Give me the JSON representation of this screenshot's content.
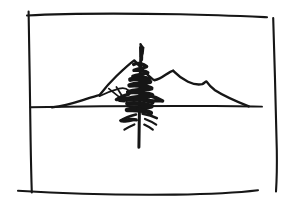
{
  "artwork": {
    "title": "Mountain Landscape with Conifer",
    "medium": "ink pen sketch",
    "surface": "white paper",
    "ink_color": "#161616",
    "paper_color": "#ffffff",
    "canvas": {
      "width": 290,
      "height": 212
    }
  },
  "chart_data": {
    "type": "line",
    "xlabel": "",
    "ylabel": "",
    "grid": false,
    "legend": null,
    "xlim": [
      0,
      290
    ],
    "ylim": [
      212,
      0
    ],
    "series": [
      {
        "name": "frame-top",
        "points": [
          [
            27,
            15
          ],
          [
            96,
            13
          ],
          [
            180,
            14
          ],
          [
            267,
            17
          ]
        ]
      },
      {
        "name": "frame-left",
        "points": [
          [
            29,
            12
          ],
          [
            30,
            70
          ],
          [
            31,
            130
          ],
          [
            32,
            192
          ]
        ]
      },
      {
        "name": "frame-right",
        "points": [
          [
            273,
            18
          ],
          [
            275,
            90
          ],
          [
            277,
            150
          ],
          [
            276,
            191
          ]
        ]
      },
      {
        "name": "frame-bottom",
        "points": [
          [
            18,
            191
          ],
          [
            90,
            194
          ],
          [
            170,
            195
          ],
          [
            258,
            190
          ]
        ]
      },
      {
        "name": "horizon",
        "points": [
          [
            31,
            107
          ],
          [
            100,
            106
          ],
          [
            180,
            106
          ],
          [
            262,
            106
          ]
        ]
      },
      {
        "name": "ridge-left-foothill",
        "points": [
          [
            55,
            107
          ],
          [
            70,
            104
          ],
          [
            83,
            100
          ],
          [
            93,
            96
          ],
          [
            99,
            95
          ]
        ]
      },
      {
        "name": "ridge-main",
        "points": [
          [
            99,
            95
          ],
          [
            106,
            86
          ],
          [
            116,
            76
          ],
          [
            126,
            68
          ],
          [
            134,
            61
          ],
          [
            140,
            66
          ],
          [
            147,
            73
          ],
          [
            154,
            79
          ],
          [
            161,
            78
          ],
          [
            168,
            74
          ],
          [
            173,
            72
          ]
        ]
      },
      {
        "name": "ridge-right",
        "points": [
          [
            173,
            72
          ],
          [
            182,
            79
          ],
          [
            192,
            83
          ],
          [
            201,
            84
          ],
          [
            206,
            82
          ],
          [
            211,
            87
          ],
          [
            222,
            93
          ],
          [
            236,
            100
          ],
          [
            249,
            106
          ]
        ]
      },
      {
        "name": "ridge-inner-crease",
        "points": [
          [
            99,
            96
          ],
          [
            110,
            92
          ],
          [
            120,
            88
          ],
          [
            128,
            90
          ]
        ]
      },
      {
        "name": "ridge-slope-line",
        "points": [
          [
            109,
            89
          ],
          [
            118,
            95
          ],
          [
            126,
            101
          ]
        ]
      },
      {
        "name": "tree-trunk",
        "points": [
          [
            141,
            46
          ],
          [
            140,
            70
          ],
          [
            139,
            100
          ],
          [
            139,
            125
          ],
          [
            139,
            147
          ]
        ]
      },
      {
        "name": "tree-tip",
        "points": [
          [
            140,
            52
          ],
          [
            141,
            45
          ],
          [
            144,
            48
          ],
          [
            143,
            56
          ]
        ]
      }
    ],
    "annotations": [
      {
        "label": "conifer-foliage-scribble",
        "center": [
          140,
          85
        ]
      },
      {
        "label": "lower-branch-cluster",
        "center": [
          133,
          122
        ]
      }
    ]
  },
  "figure": {
    "frame_label": "picture frame border",
    "horizon_label": "horizon line",
    "mountains_label": "mountain ridge silhouette",
    "tree_label": "scribbled pine tree"
  }
}
